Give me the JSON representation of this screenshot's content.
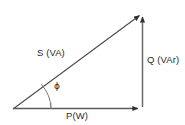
{
  "diagram": {
    "background_color": "#ffffff",
    "stroke_color": "#3a3a3a",
    "text_color": "#2b2b2b",
    "labels": {
      "hypotenuse": "S (VA)",
      "vertical": "Q (VAr)",
      "horizontal": "P(W)",
      "angle": "ϕ"
    },
    "geometry": {
      "origin_x": 13,
      "origin_y": 109,
      "apex_x": 142,
      "apex_y": 13,
      "corner_x": 142,
      "corner_y": 109,
      "arc_radius": 38
    },
    "icons": {
      "arrow_apex_hypotenuse": "arrowhead-icon",
      "arrow_apex_vertical": "arrowhead-icon",
      "arrow_corner_horizontal": "arrowhead-icon"
    }
  }
}
